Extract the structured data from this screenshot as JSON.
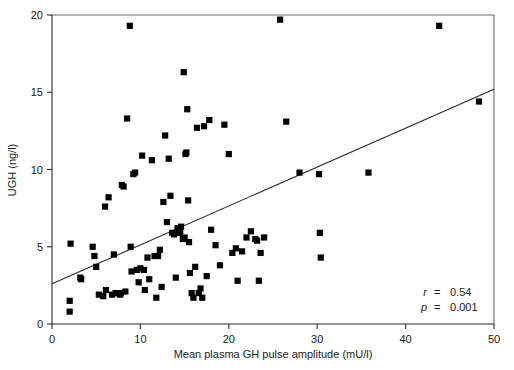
{
  "chart_data": {
    "type": "scatter",
    "title": "",
    "xlabel": "Mean plasma GH pulse amplitude (mU/l)",
    "ylabel": "UGH (ng/l)",
    "xlim": [
      0,
      50
    ],
    "ylim": [
      0,
      20
    ],
    "xticks": [
      0,
      10,
      20,
      30,
      40,
      50
    ],
    "yticks": [
      0,
      5,
      10,
      15,
      20
    ],
    "xtick_labels": [
      "0",
      "10",
      "20",
      "30",
      "40",
      "50"
    ],
    "ytick_labels": [
      "0",
      "5",
      "10",
      "15",
      "20"
    ],
    "grid": false,
    "legend": null,
    "marker": "square",
    "marker_color": "#000000",
    "points": [
      [
        2.0,
        1.5
      ],
      [
        2.0,
        0.8
      ],
      [
        2.1,
        5.2
      ],
      [
        3.2,
        3.0
      ],
      [
        3.3,
        2.9
      ],
      [
        4.6,
        5.0
      ],
      [
        4.8,
        4.4
      ],
      [
        5.0,
        3.7
      ],
      [
        5.3,
        1.9
      ],
      [
        5.8,
        1.8
      ],
      [
        6.0,
        7.6
      ],
      [
        6.1,
        2.2
      ],
      [
        6.4,
        8.2
      ],
      [
        6.8,
        1.9
      ],
      [
        7.0,
        4.5
      ],
      [
        7.2,
        2.0
      ],
      [
        7.5,
        2.0
      ],
      [
        7.7,
        1.9
      ],
      [
        7.8,
        2.0
      ],
      [
        7.9,
        9.0
      ],
      [
        8.1,
        8.9
      ],
      [
        8.3,
        2.1
      ],
      [
        8.5,
        13.3
      ],
      [
        8.8,
        19.3
      ],
      [
        8.9,
        5.0
      ],
      [
        9.0,
        3.4
      ],
      [
        9.2,
        9.7
      ],
      [
        9.4,
        9.8
      ],
      [
        9.6,
        3.5
      ],
      [
        9.8,
        2.7
      ],
      [
        10.0,
        3.6
      ],
      [
        10.2,
        10.9
      ],
      [
        10.4,
        3.5
      ],
      [
        10.5,
        2.2
      ],
      [
        10.8,
        4.3
      ],
      [
        11.0,
        2.9
      ],
      [
        11.3,
        10.6
      ],
      [
        11.6,
        4.4
      ],
      [
        11.8,
        1.7
      ],
      [
        12.0,
        4.4
      ],
      [
        12.2,
        4.8
      ],
      [
        12.4,
        2.4
      ],
      [
        12.6,
        7.9
      ],
      [
        12.8,
        12.2
      ],
      [
        13.0,
        6.6
      ],
      [
        13.2,
        10.7
      ],
      [
        13.4,
        8.3
      ],
      [
        13.6,
        5.9
      ],
      [
        13.8,
        5.8
      ],
      [
        14.0,
        3.0
      ],
      [
        14.2,
        6.2
      ],
      [
        14.4,
        5.9
      ],
      [
        14.5,
        6.0
      ],
      [
        14.6,
        6.3
      ],
      [
        14.8,
        5.5
      ],
      [
        14.9,
        16.3
      ],
      [
        15.0,
        5.6
      ],
      [
        15.1,
        11.0
      ],
      [
        15.2,
        11.1
      ],
      [
        15.3,
        13.9
      ],
      [
        15.4,
        8.0
      ],
      [
        15.5,
        5.3
      ],
      [
        15.6,
        3.3
      ],
      [
        15.8,
        2.0
      ],
      [
        16.0,
        1.7
      ],
      [
        16.2,
        3.7
      ],
      [
        16.4,
        12.7
      ],
      [
        16.6,
        2.0
      ],
      [
        16.8,
        2.3
      ],
      [
        17.0,
        1.7
      ],
      [
        17.2,
        12.8
      ],
      [
        17.5,
        3.1
      ],
      [
        17.8,
        13.2
      ],
      [
        18.0,
        6.1
      ],
      [
        18.5,
        5.1
      ],
      [
        19.0,
        3.8
      ],
      [
        19.5,
        12.9
      ],
      [
        20.0,
        11.0
      ],
      [
        20.4,
        4.6
      ],
      [
        20.8,
        4.9
      ],
      [
        21.0,
        2.8
      ],
      [
        21.5,
        4.7
      ],
      [
        22.0,
        5.6
      ],
      [
        22.5,
        6.0
      ],
      [
        23.0,
        5.5
      ],
      [
        23.2,
        5.4
      ],
      [
        23.4,
        2.8
      ],
      [
        23.6,
        4.6
      ],
      [
        24.0,
        5.6
      ],
      [
        25.8,
        19.7
      ],
      [
        26.5,
        13.1
      ],
      [
        28.0,
        9.8
      ],
      [
        30.2,
        9.7
      ],
      [
        30.3,
        5.9
      ],
      [
        30.4,
        4.3
      ],
      [
        35.8,
        9.8
      ],
      [
        43.8,
        19.3
      ],
      [
        48.3,
        14.4
      ]
    ],
    "fit_line": {
      "x0": 0,
      "y0": 2.6,
      "x1": 50,
      "y1": 15.2
    },
    "annotations": {
      "r_symbol": "r",
      "r_eq": "=",
      "r_value": "0.54",
      "p_symbol": "p",
      "p_eq": "=",
      "p_value": "0.001"
    }
  }
}
